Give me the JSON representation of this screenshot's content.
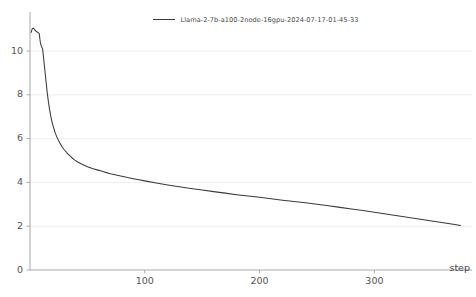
{
  "chart_data": {
    "type": "line",
    "title": "",
    "xlabel": "step",
    "ylabel": "",
    "legend_position": "top-center",
    "grid": true,
    "xlim": [
      0,
      385
    ],
    "ylim": [
      0,
      11.6
    ],
    "x_ticks": [
      100,
      200,
      300
    ],
    "x_tick_labels": [
      "100",
      "200",
      "300"
    ],
    "y_ticks": [
      0,
      2,
      4,
      6,
      8,
      10
    ],
    "y_tick_labels": [
      "0",
      "2",
      "4",
      "6",
      "8",
      "10"
    ],
    "series": [
      {
        "name": "Llama-2-7b-a100-2node-16gpu-2024-07-17-01-45-33",
        "color": "#3a3a3a",
        "x": [
          1,
          2,
          3,
          4,
          5,
          6,
          7,
          8,
          9,
          10,
          11,
          12,
          13,
          14,
          15,
          16,
          17,
          18,
          19,
          20,
          22,
          24,
          26,
          28,
          30,
          33,
          36,
          39,
          42,
          45,
          50,
          55,
          60,
          65,
          70,
          75,
          80,
          85,
          90,
          95,
          100,
          110,
          120,
          130,
          140,
          150,
          160,
          170,
          180,
          190,
          200,
          210,
          220,
          230,
          240,
          250,
          260,
          270,
          280,
          290,
          300,
          310,
          320,
          330,
          340,
          350,
          360,
          370,
          375
        ],
        "y": [
          10.85,
          11.02,
          11.05,
          10.98,
          10.92,
          10.88,
          10.84,
          10.8,
          10.4,
          10.2,
          10.1,
          9.6,
          9.1,
          8.6,
          8.1,
          7.7,
          7.35,
          7.05,
          6.8,
          6.6,
          6.25,
          6.0,
          5.8,
          5.62,
          5.48,
          5.3,
          5.15,
          5.02,
          4.92,
          4.84,
          4.72,
          4.62,
          4.55,
          4.47,
          4.4,
          4.34,
          4.28,
          4.22,
          4.17,
          4.12,
          4.07,
          3.97,
          3.88,
          3.8,
          3.72,
          3.65,
          3.58,
          3.51,
          3.44,
          3.38,
          3.32,
          3.25,
          3.19,
          3.13,
          3.07,
          3.0,
          2.93,
          2.86,
          2.79,
          2.72,
          2.64,
          2.56,
          2.48,
          2.4,
          2.32,
          2.24,
          2.16,
          2.08,
          2.03
        ]
      }
    ]
  },
  "legend": {
    "entry_label": "Llama-2-7b-a100-2node-16gpu-2024-07-17-01-45-33"
  },
  "axes": {
    "x_title": "step"
  }
}
